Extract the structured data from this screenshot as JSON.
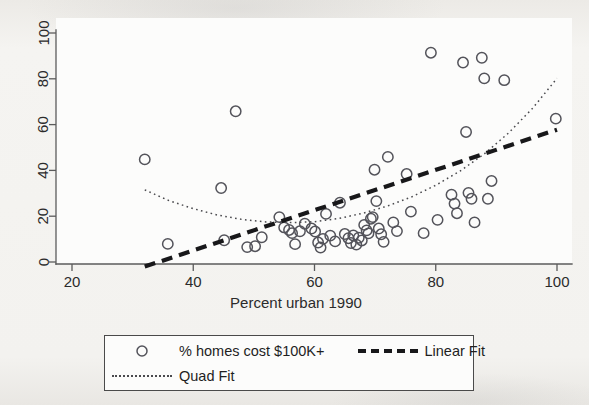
{
  "chart_data": {
    "type": "scatter",
    "title": "",
    "xlabel": "Percent urban 1990",
    "ylabel": "",
    "xlim": [
      20,
      102
    ],
    "ylim": [
      -4,
      104
    ],
    "xticks": [
      20,
      40,
      60,
      80,
      100
    ],
    "yticks": [
      0,
      20,
      40,
      60,
      80,
      100
    ],
    "grid": false,
    "legend_position": "below-plot",
    "series": [
      {
        "name": "% homes cost $100K+",
        "marker": "open-circle",
        "type": "scatter",
        "points": [
          [
            32.0,
            44.8
          ],
          [
            35.8,
            7.9
          ],
          [
            44.6,
            32.3
          ],
          [
            45.1,
            9.5
          ],
          [
            47.0,
            65.8
          ],
          [
            48.9,
            6.5
          ],
          [
            50.2,
            6.9
          ],
          [
            51.3,
            10.8
          ],
          [
            54.2,
            19.6
          ],
          [
            55.0,
            15.1
          ],
          [
            55.8,
            14.0
          ],
          [
            56.3,
            12.6
          ],
          [
            56.8,
            7.8
          ],
          [
            57.6,
            13.4
          ],
          [
            58.4,
            16.7
          ],
          [
            59.5,
            14.6
          ],
          [
            60.1,
            13.3
          ],
          [
            60.6,
            8.5
          ],
          [
            61.0,
            6.3
          ],
          [
            61.4,
            10.1
          ],
          [
            61.9,
            21.0
          ],
          [
            62.6,
            11.5
          ],
          [
            63.4,
            9.0
          ],
          [
            64.2,
            25.9
          ],
          [
            65.0,
            12.2
          ],
          [
            65.6,
            10.4
          ],
          [
            66.0,
            8.3
          ],
          [
            66.4,
            11.6
          ],
          [
            66.9,
            7.6
          ],
          [
            67.3,
            10.6
          ],
          [
            67.8,
            9.4
          ],
          [
            68.2,
            16.2
          ],
          [
            68.6,
            13.8
          ],
          [
            68.9,
            12.5
          ],
          [
            69.3,
            18.9
          ],
          [
            69.6,
            19.6
          ],
          [
            69.9,
            40.3
          ],
          [
            70.2,
            26.6
          ],
          [
            70.6,
            14.6
          ],
          [
            71.0,
            12.1
          ],
          [
            71.4,
            8.8
          ],
          [
            72.1,
            45.9
          ],
          [
            73.0,
            17.3
          ],
          [
            73.6,
            13.5
          ],
          [
            75.2,
            38.4
          ],
          [
            75.9,
            22.0
          ],
          [
            78.0,
            12.6
          ],
          [
            79.2,
            91.4
          ],
          [
            80.3,
            18.4
          ],
          [
            82.6,
            29.4
          ],
          [
            83.1,
            25.5
          ],
          [
            83.5,
            21.3
          ],
          [
            84.5,
            87.1
          ],
          [
            85.0,
            56.8
          ],
          [
            85.4,
            30.2
          ],
          [
            85.9,
            27.6
          ],
          [
            86.4,
            17.3
          ],
          [
            87.6,
            89.2
          ],
          [
            88.0,
            80.2
          ],
          [
            88.6,
            27.6
          ],
          [
            89.2,
            35.4
          ],
          [
            91.3,
            79.4
          ],
          [
            99.8,
            62.6
          ]
        ]
      },
      {
        "name": "Linear Fit",
        "type": "line",
        "style": "dashed",
        "points": [
          [
            32.0,
            -2.0
          ],
          [
            100.0,
            57.8
          ]
        ]
      },
      {
        "name": "Quad Fit",
        "type": "line",
        "style": "dotted",
        "points": [
          [
            32.0,
            31.5
          ],
          [
            36.0,
            26.8
          ],
          [
            40.0,
            23.3
          ],
          [
            44.0,
            20.5
          ],
          [
            48.0,
            18.6
          ],
          [
            52.0,
            17.5
          ],
          [
            56.0,
            17.2
          ],
          [
            60.0,
            17.6
          ],
          [
            64.0,
            19.0
          ],
          [
            68.0,
            21.3
          ],
          [
            72.0,
            24.4
          ],
          [
            76.0,
            28.4
          ],
          [
            80.0,
            33.5
          ],
          [
            84.0,
            39.7
          ],
          [
            88.0,
            47.2
          ],
          [
            92.0,
            56.3
          ],
          [
            96.0,
            67.2
          ],
          [
            100.0,
            80.2
          ]
        ]
      }
    ],
    "legend_entries": [
      {
        "label": "% homes cost $100K+",
        "key": "open-circle"
      },
      {
        "label": "Linear Fit",
        "key": "thick-dashed-line"
      },
      {
        "label": "Quad Fit",
        "key": "dotted-line"
      }
    ]
  },
  "axes": {
    "x_title": "Percent urban 1990",
    "x_tick_labels": [
      "20",
      "40",
      "60",
      "80",
      "100"
    ],
    "y_tick_labels": [
      "0",
      "20",
      "40",
      "60",
      "80",
      "100"
    ]
  },
  "legend": {
    "series_label": "% homes cost $100K+",
    "linear_label": "Linear Fit",
    "quad_label": "Quad Fit"
  },
  "colors": {
    "marker_stroke": "#53535a",
    "linear_fit": "#18181a",
    "quad_fit": "#4a4a4e",
    "axis": "#5b5b5b",
    "text": "#1f1f1f",
    "plot_background": "#fcfcfb",
    "page_background": "#f2f1ee"
  }
}
